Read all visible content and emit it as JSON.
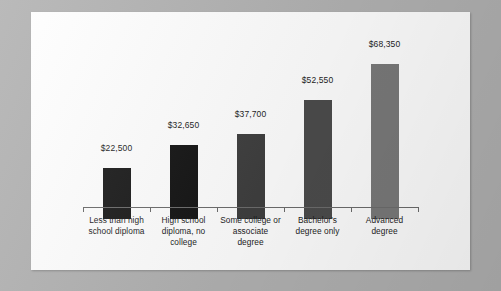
{
  "chart_data": {
    "type": "bar",
    "title": "",
    "subtitle": "",
    "xlabel": "",
    "ylabel": "",
    "grid": false,
    "legend": "none",
    "ylim": [
      0,
      75000
    ],
    "categories": [
      "Less than high school diploma",
      "High school diploma, no college",
      "Some college or associate degree",
      "Bachelor's degree only",
      "Advanced degree"
    ],
    "category_lines": [
      [
        "Less than high",
        "school diploma"
      ],
      [
        "High school",
        "diploma, no",
        "college"
      ],
      [
        "Some college or",
        "associate",
        "degree"
      ],
      [
        "Bachelor's",
        "degree only"
      ],
      [
        "Advanced",
        "degree"
      ]
    ],
    "values": [
      22500,
      32650,
      37700,
      52550,
      68350
    ],
    "value_labels": [
      "$22,500",
      "$32,650",
      "$37,700",
      "$52,550",
      "$68,350"
    ],
    "bar_colors": [
      "#1d1d1d",
      "#151515",
      "#3f3f3f",
      "#4c4c4c",
      "#7a7a7a"
    ]
  },
  "figure": {
    "panel_background": "#ffffff",
    "backdrop_color": "#b2b2b2",
    "axis_color": "#6d6d6d",
    "text_color": "#1d1d1d"
  }
}
